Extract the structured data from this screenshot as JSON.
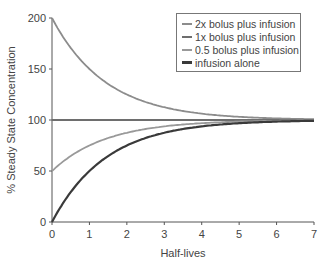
{
  "chart_data": {
    "type": "line",
    "title": "",
    "xlabel": "Half-lives",
    "ylabel": "% Steady State Concentration",
    "xlim": [
      0,
      7
    ],
    "ylim": [
      0,
      200
    ],
    "xticks": [
      0,
      1,
      2,
      3,
      4,
      5,
      6,
      7
    ],
    "yticks": [
      0,
      50,
      100,
      150,
      200
    ],
    "grid": false,
    "legend_position": "upper right",
    "x": [
      0,
      0.5,
      1,
      1.5,
      2,
      2.5,
      3,
      3.5,
      4,
      4.5,
      5,
      5.5,
      6,
      6.5,
      7
    ],
    "series": [
      {
        "name": "2x bolus plus infusion",
        "color": "#8c8c8c",
        "values": [
          200,
          170.7,
          150,
          135.4,
          125,
          117.7,
          112.5,
          108.8,
          106.3,
          104.4,
          103.1,
          102.2,
          101.6,
          101.1,
          100.8
        ]
      },
      {
        "name": "1x bolus plus infusion",
        "color": "#6e6e6e",
        "values": [
          100,
          100,
          100,
          100,
          100,
          100,
          100,
          100,
          100,
          100,
          100,
          100,
          100,
          100,
          100
        ]
      },
      {
        "name": "0.5 bolus plus infusion",
        "color": "#999999",
        "values": [
          50,
          64.6,
          75,
          82.3,
          87.5,
          91.2,
          93.8,
          95.6,
          96.9,
          97.8,
          98.4,
          98.9,
          99.2,
          99.4,
          99.6
        ]
      },
      {
        "name": "infusion alone",
        "color": "#3a3a3a",
        "values": [
          0,
          29.3,
          50,
          64.6,
          75,
          82.3,
          87.5,
          91.2,
          93.8,
          95.6,
          96.9,
          97.8,
          98.4,
          98.9,
          99.2
        ]
      }
    ]
  },
  "legend": {
    "items": [
      {
        "label": "2x bolus plus infusion",
        "color": "#8c8c8c"
      },
      {
        "label": "1x bolus plus infusion",
        "color": "#6e6e6e"
      },
      {
        "label": "0.5 bolus plus infusion",
        "color": "#999999"
      },
      {
        "label": "infusion alone",
        "color": "#3a3a3a"
      }
    ]
  }
}
